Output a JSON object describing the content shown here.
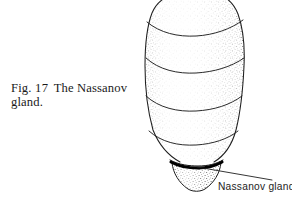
{
  "figure": {
    "caption_line_1_prefix": "Fig.",
    "caption_number": "17",
    "caption_line_1_text": "The Nassanov",
    "caption_line_2_text": "gland.",
    "caption_full": "Fig. 17  The Nassanov gland.",
    "background_color": "#ffffff",
    "ink_color": "#1a1a1a",
    "stipple_color": "#555555",
    "gland_band_color": "#000000"
  },
  "illustration": {
    "subject": "honeybee-abdomen-lateral",
    "technique": "pen-and-ink-stipple",
    "segments": [
      {
        "name": "tergite-1",
        "label": "abdominal segment 1"
      },
      {
        "name": "tergite-2",
        "label": "abdominal segment 2"
      },
      {
        "name": "tergite-3",
        "label": "abdominal segment 3"
      },
      {
        "name": "tergite-4",
        "label": "abdominal segment 4"
      },
      {
        "name": "tergite-5",
        "label": "abdominal segment 5"
      },
      {
        "name": "abdomen-tip",
        "label": "terminal segment"
      }
    ],
    "bounds": {
      "left": 145,
      "top": 0,
      "right": 245,
      "bottom": 192
    }
  },
  "annotation": {
    "label_text": "Nassanov gland",
    "leader_from": {
      "x": 197,
      "y": 166
    },
    "leader_to": {
      "x": 272,
      "y": 180
    }
  }
}
